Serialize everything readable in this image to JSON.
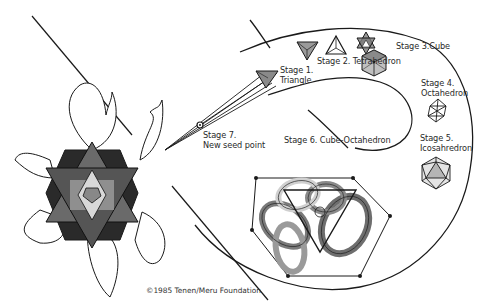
{
  "diagram": {
    "type": "spiral-progression",
    "stages": [
      {
        "id": 1,
        "label_line1": "Stage 1.",
        "label_line2": "Triangle",
        "icon": "triangle-icon"
      },
      {
        "id": 2,
        "label_line1": "Stage 2. Tetrahedron",
        "label_line2": "",
        "icon": "tetrahedron-icon"
      },
      {
        "id": "2b",
        "label_line1": "",
        "label_line2": "",
        "icon": "star-tetrahedron-icon"
      },
      {
        "id": 3,
        "label_line1": "Stage 3.Cube",
        "label_line2": "",
        "icon": "cube-icon"
      },
      {
        "id": 4,
        "label_line1": "Stage 4.",
        "label_line2": "Octahedron",
        "icon": "octahedron-icon"
      },
      {
        "id": 5,
        "label_line1": "Stage 5.",
        "label_line2": "Icosahredron",
        "icon": "icosahedron-icon"
      },
      {
        "id": 6,
        "label_line1": "Stage 6. Cube-Octahedron",
        "label_line2": "",
        "icon": "cube-octahedron-icon"
      },
      {
        "id": 7,
        "label_line1": "Stage 7.",
        "label_line2": "New seed point",
        "icon": "seed-point-icon"
      }
    ],
    "copyright": "©1985 Tenen/Meru Foundation",
    "left_figure": "hexagonal-flower-mandala",
    "colors": {
      "line": "#1a1a1a",
      "fill_gray": "#8a8a8a",
      "fill_light": "#c8c8c8",
      "background": "#ffffff"
    }
  }
}
